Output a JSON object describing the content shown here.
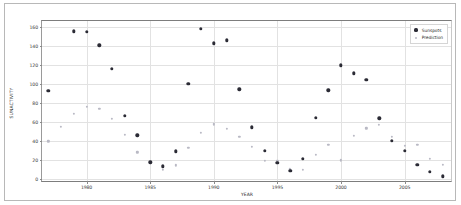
{
  "chart_data": {
    "type": "scatter",
    "title": "",
    "xlabel": "YEAR",
    "ylabel": "SUNACTIVITY",
    "xlim": [
      1976.5,
      2008.8
    ],
    "ylim": [
      -4,
      166
    ],
    "grid": true,
    "legend_position": "upper right",
    "xticks": [
      1980,
      1985,
      1990,
      1995,
      2000,
      2005
    ],
    "xtick_labels": [
      "1980",
      "1985",
      "1990",
      "1995",
      "2000",
      "2005"
    ],
    "yticks": [
      0,
      20,
      40,
      60,
      80,
      100,
      120,
      140,
      160
    ],
    "ytick_labels": [
      "0",
      "20",
      "40",
      "60",
      "80",
      "100",
      "120",
      "140",
      "160"
    ],
    "colors": {
      "sunspots": "#2b2b35",
      "prediction": "#b9b9c4",
      "grid": "#e2e2e2",
      "axis": "#7d7d7d",
      "background": "#ffffff"
    },
    "series": [
      {
        "name": "Sunspots",
        "marker": "circle-filled",
        "color": "#2b2b35",
        "points": [
          {
            "x": 1977,
            "y": 92.5
          },
          {
            "x": 1979,
            "y": 155.0
          },
          {
            "x": 1980,
            "y": 154.5
          },
          {
            "x": 1981,
            "y": 140.5
          },
          {
            "x": 1982,
            "y": 115.9
          },
          {
            "x": 1983,
            "y": 66.6
          },
          {
            "x": 1984,
            "y": 45.9
          },
          {
            "x": 1985,
            "y": 17.9
          },
          {
            "x": 1986,
            "y": 13.4
          },
          {
            "x": 1987,
            "y": 29.4
          },
          {
            "x": 1988,
            "y": 100.2
          },
          {
            "x": 1989,
            "y": 157.6
          },
          {
            "x": 1990,
            "y": 142.6
          },
          {
            "x": 1991,
            "y": 145.7
          },
          {
            "x": 1992,
            "y": 94.3
          },
          {
            "x": 1993,
            "y": 54.6
          },
          {
            "x": 1994,
            "y": 29.9
          },
          {
            "x": 1995,
            "y": 17.5
          },
          {
            "x": 1996,
            "y": 8.6
          },
          {
            "x": 1997,
            "y": 21.5
          },
          {
            "x": 1998,
            "y": 64.3
          },
          {
            "x": 1999,
            "y": 93.3
          },
          {
            "x": 2000,
            "y": 119.6
          },
          {
            "x": 2001,
            "y": 111.0
          },
          {
            "x": 2002,
            "y": 104.0
          },
          {
            "x": 2003,
            "y": 63.7
          },
          {
            "x": 2004,
            "y": 40.4
          },
          {
            "x": 2005,
            "y": 29.8
          },
          {
            "x": 2006,
            "y": 15.2
          },
          {
            "x": 2007,
            "y": 7.5
          },
          {
            "x": 2008,
            "y": 2.9
          }
        ]
      },
      {
        "name": "Prediction",
        "marker": "circle-open",
        "color": "#b9b9c4",
        "points": [
          {
            "x": 1977,
            "y": 39.8
          },
          {
            "x": 1978,
            "y": 55.0
          },
          {
            "x": 1979,
            "y": 68.5
          },
          {
            "x": 1980,
            "y": 75.6
          },
          {
            "x": 1981,
            "y": 73.5
          },
          {
            "x": 1982,
            "y": 63.0
          },
          {
            "x": 1983,
            "y": 46.4
          },
          {
            "x": 1984,
            "y": 28.1
          },
          {
            "x": 1985,
            "y": 17.0
          },
          {
            "x": 1986,
            "y": 10.1
          },
          {
            "x": 1987,
            "y": 14.5
          },
          {
            "x": 1988,
            "y": 33.1
          },
          {
            "x": 1989,
            "y": 48.5
          },
          {
            "x": 1990,
            "y": 57.4
          },
          {
            "x": 1991,
            "y": 52.6
          },
          {
            "x": 1992,
            "y": 44.3
          },
          {
            "x": 1993,
            "y": 33.9
          },
          {
            "x": 1994,
            "y": 19.6
          },
          {
            "x": 1995,
            "y": 19.0
          },
          {
            "x": 1996,
            "y": 10.2
          },
          {
            "x": 1997,
            "y": 9.6
          },
          {
            "x": 1998,
            "y": 25.6
          },
          {
            "x": 1999,
            "y": 36.1
          },
          {
            "x": 2000,
            "y": 19.8
          },
          {
            "x": 2001,
            "y": 45.2
          },
          {
            "x": 2002,
            "y": 53.2
          },
          {
            "x": 2003,
            "y": 57.3
          },
          {
            "x": 2004,
            "y": 44.7
          },
          {
            "x": 2005,
            "y": 34.9
          },
          {
            "x": 2006,
            "y": 36.3
          },
          {
            "x": 2007,
            "y": 21.0
          },
          {
            "x": 2008,
            "y": 14.8
          }
        ]
      }
    ]
  },
  "legend": {
    "items": [
      {
        "label": "Sunspots",
        "marker": "sunspots"
      },
      {
        "label": "Prediction",
        "marker": "prediction"
      }
    ]
  }
}
